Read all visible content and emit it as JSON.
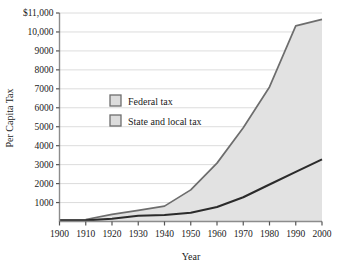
{
  "chart_data": {
    "type": "area",
    "title": "",
    "xlabel": "Year",
    "ylabel": "Per Capita Tax",
    "x": [
      1900,
      1910,
      1920,
      1930,
      1940,
      1950,
      1960,
      1970,
      1980,
      1990,
      2000
    ],
    "xtick_labels": [
      "1900",
      "1910",
      "1920",
      "1930",
      "1940",
      "1950",
      "1960",
      "1970",
      "1980",
      "1990",
      "2000"
    ],
    "ytick_labels": [
      "$11,000",
      "10,000",
      "9000",
      "8000",
      "7000",
      "6000",
      "5000",
      "4000",
      "3000",
      "2000",
      "1000"
    ],
    "ytick_values": [
      11000,
      10000,
      9000,
      8000,
      7000,
      6000,
      5000,
      4000,
      3000,
      2000,
      1000
    ],
    "xlim": [
      1900,
      2000
    ],
    "ylim": [
      0,
      11000
    ],
    "grid": "horizontal",
    "legend_position": "upper-left-inside",
    "stacked": true,
    "series": [
      {
        "name": "State and local tax",
        "key": "state_local",
        "values": [
          55,
          60,
          145,
          300,
          340,
          460,
          760,
          1280,
          1950,
          2620,
          3280
        ],
        "fill": "#e2e2e2",
        "line": "#2b2b2b"
      },
      {
        "name": "Federal tax",
        "key": "federal",
        "values": [
          35,
          45,
          230,
          290,
          470,
          1210,
          2320,
          3670,
          5150,
          7700,
          7380
        ],
        "fill": "#e2e2e2",
        "line": "#6d6d6d"
      }
    ],
    "totals": [
      90,
      105,
      375,
      590,
      810,
      1670,
      3080,
      4950,
      7100,
      10320,
      10660
    ],
    "axis_color": "#8c8c8c",
    "grid_color": "#d8d8d8",
    "plot_background": "#ffffff",
    "page_background": "#ffffff"
  },
  "legend": {
    "items": [
      {
        "label": "Federal tax",
        "swatch_fill": "#dcdcdc",
        "swatch_border": "#6e6e6e"
      },
      {
        "label": "State and local tax",
        "swatch_fill": "#dcdcdc",
        "swatch_border": "#6e6e6e"
      }
    ]
  }
}
